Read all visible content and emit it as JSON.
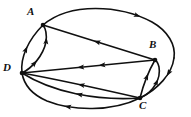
{
  "figure": {
    "type": "directed-multigraph",
    "width": 191,
    "height": 117,
    "background_color": "#ffffff",
    "stroke_color": "#101010",
    "label_color": "#111111"
  },
  "labels": {
    "a": "A",
    "b": "B",
    "c": "C",
    "d": "D"
  },
  "vertices": [
    {
      "id": "A",
      "label": "A",
      "x": 43,
      "y": 25,
      "label_x": 27,
      "label_y": 6
    },
    {
      "id": "B",
      "label": "B",
      "x": 155,
      "y": 60,
      "label_x": 149,
      "label_y": 39
    },
    {
      "id": "C",
      "label": "C",
      "x": 140,
      "y": 98,
      "label_x": 139,
      "label_y": 100
    },
    {
      "id": "D",
      "label": "D",
      "x": 22,
      "y": 73,
      "label_x": 3,
      "label_y": 62
    }
  ],
  "edges": [
    {
      "id": "e1",
      "from": "A",
      "to": "B",
      "style": "arc-outer-top",
      "arrows": 2
    },
    {
      "id": "e2",
      "from": "B",
      "to": "C",
      "style": "arc-outer-right",
      "arrows": 1
    },
    {
      "id": "e3",
      "from": "C",
      "to": "D",
      "style": "arc-outer-bottom",
      "arrows": 1
    },
    {
      "id": "e4",
      "from": "D",
      "to": "A",
      "style": "arc-outer-left",
      "arrows": 1
    },
    {
      "id": "e5",
      "from": "D",
      "to": "A",
      "style": "lens-inner-left",
      "arrows": 1
    },
    {
      "id": "e6",
      "from": "B",
      "to": "A",
      "style": "straight",
      "arrows": 1
    },
    {
      "id": "e7",
      "from": "D",
      "to": "B",
      "style": "straight",
      "arrows": 2
    },
    {
      "id": "e8",
      "from": "D",
      "to": "C",
      "style": "curve-upper",
      "arrows": 1
    },
    {
      "id": "e9",
      "from": "D",
      "to": "C",
      "style": "curve-lower",
      "arrows": 1
    },
    {
      "id": "e10",
      "from": "C",
      "to": "B",
      "style": "lens-inner-right",
      "arrows": 1
    },
    {
      "id": "e11",
      "from": "C",
      "to": "B",
      "style": "lens-outer-right",
      "arrows": 1
    }
  ],
  "paths": {
    "outer_ellipse_top": "M 43 25 C 70 2 120 5 152 22 C 168 31 176 45 174 58",
    "outer_ellipse_right": "M 174 58 C 172 74 158 89 140 98",
    "outer_ellipse_bottom": "M 140 98 C 112 112 72 111 47 101 C 33 95 24 85 22 73",
    "outer_ellipse_left": "M 22 73 C 20 58 28 40 43 25",
    "lens_da_inner": "M 22 73 C 32 68 43 56 46 42 C 47 34 46 29 43 25",
    "edge_ba": "M 155 60 L 43 25",
    "edge_db": "M 22 73 L 155 60",
    "edge_dc_upper": "M 22 73 C 60 80 105 90 140 98",
    "edge_dc_lower": "M 22 73 C 52 92 96 101 140 98",
    "lens_cb_inner": "M 140 98 C 143 86 148 72 155 60",
    "lens_cb_outer": "M 140 98 C 154 92 161 78 159 67 C 158 63 157 61 155 60"
  },
  "arrow_markers": [
    {
      "on": "outer_ellipse_top",
      "t": 0.62,
      "direction": "forward"
    },
    {
      "on": "outer_ellipse_right",
      "t": 0.3,
      "direction": "forward"
    },
    {
      "on": "outer_ellipse_bottom",
      "t": 0.55,
      "direction": "forward"
    },
    {
      "on": "outer_ellipse_left",
      "t": 0.45,
      "direction": "forward"
    },
    {
      "on": "lens_da_inner",
      "t": 0.28,
      "direction": "forward"
    },
    {
      "on": "lens_da_inner",
      "t": 0.72,
      "direction": "forward"
    },
    {
      "on": "edge_ba",
      "t": 0.52,
      "direction": "forward"
    },
    {
      "on": "edge_db",
      "t": 0.44,
      "direction": "backward"
    },
    {
      "on": "edge_db",
      "t": 0.6,
      "direction": "backward"
    },
    {
      "on": "edge_dc_upper",
      "t": 0.5,
      "direction": "backward"
    },
    {
      "on": "edge_dc_lower",
      "t": 0.5,
      "direction": "backward"
    },
    {
      "on": "lens_cb_inner",
      "t": 0.55,
      "direction": "forward"
    },
    {
      "on": "lens_cb_outer",
      "t": 0.5,
      "direction": "forward"
    }
  ]
}
